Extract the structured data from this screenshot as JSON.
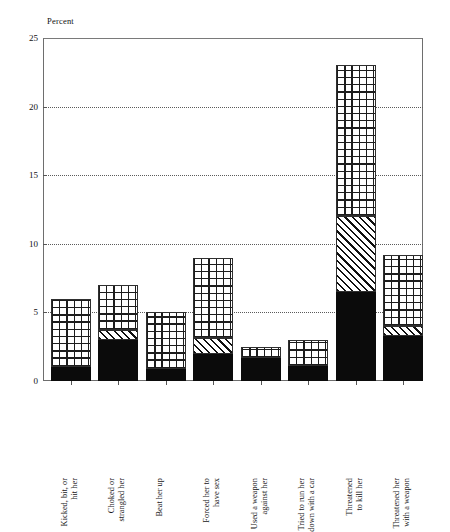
{
  "chart_data": {
    "type": "bar",
    "title": "",
    "subtitle": "",
    "xlabel": "",
    "ylabel": "Percent",
    "ylim": [
      0,
      25
    ],
    "yticks": [
      0,
      5,
      10,
      15,
      20,
      25
    ],
    "ytick_labels": [
      "0",
      "5",
      "10",
      "15",
      "20",
      "25"
    ],
    "grid": true,
    "grid_style": "dotted-horizontal",
    "legend": "none",
    "stacked": true,
    "categories": [
      "Kicked, bit, or hit her",
      "Choked or strangled her",
      "Beat her up",
      "Forced her to have sex",
      "Used a weapon against her",
      "Tried to run her down with a car",
      "Threatened to kill her",
      "Threatened her with a weapon"
    ],
    "category_lines": [
      [
        "Kicked, bit, or",
        "hit her"
      ],
      [
        "Choked or",
        "strangled her"
      ],
      [
        "Beat her up"
      ],
      [
        "Forced her to",
        "have sex"
      ],
      [
        "Used a weapon",
        "against her"
      ],
      [
        "Tried to run her",
        "down with a car"
      ],
      [
        "Threatened",
        "to kill her"
      ],
      [
        "Threatened her",
        "with a weapon"
      ]
    ],
    "series": [
      {
        "name": "solid-black-segment",
        "pattern": "solid-black",
        "values": [
          1.0,
          3.0,
          0.9,
          2.0,
          1.7,
          1.1,
          6.5,
          3.3
        ]
      },
      {
        "name": "diagonal-hatch-segment",
        "pattern": "diagonal-hatch",
        "values": [
          0.0,
          0.7,
          0.0,
          1.1,
          0.0,
          0.0,
          5.5,
          0.7
        ]
      },
      {
        "name": "crosshatch-grid-segment",
        "pattern": "crosshatch-grid",
        "values": [
          5.0,
          3.3,
          4.1,
          5.9,
          0.8,
          1.9,
          11.0,
          5.2
        ]
      }
    ],
    "totals": [
      6.0,
      7.0,
      5.0,
      9.0,
      2.5,
      3.0,
      23.0,
      9.2
    ]
  },
  "colors": {
    "background": "#ffffff",
    "axis": "#6e6e6e",
    "text": "#141414",
    "solid_fill": "#0b0b0b",
    "pattern_stroke": "#1d1d1d",
    "gridline": "#5b5b5b"
  }
}
